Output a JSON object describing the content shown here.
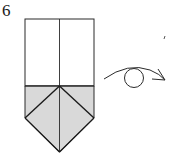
{
  "step": {
    "number": "6"
  },
  "diagram": {
    "instruction_symbol": "turn-over",
    "colors": {
      "paper_white": "#ffffff",
      "paper_colored": "#d9d9d9",
      "line": "#2a2a2a"
    }
  }
}
